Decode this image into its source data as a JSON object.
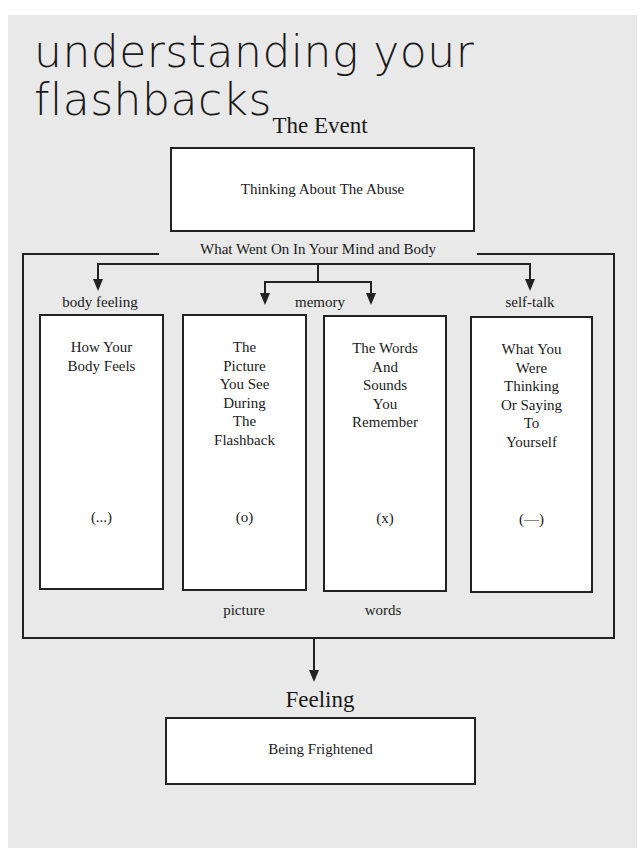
{
  "title": {
    "line1": "understanding your",
    "line2": "flashbacks"
  },
  "event": {
    "heading": "The Event",
    "box_text": "Thinking About The Abuse"
  },
  "process": {
    "label": "What Went On In Your Mind and Body",
    "categories": {
      "body_feeling": "body feeling",
      "memory": "memory",
      "self_talk": "self-talk"
    },
    "boxes": [
      {
        "lines": [
          "How Your",
          "Body Feels"
        ],
        "symbol": "(...)"
      },
      {
        "lines": [
          "The",
          "Picture",
          "You See",
          "During",
          "The",
          "Flashback"
        ],
        "symbol": "(o)"
      },
      {
        "lines": [
          "The Words",
          "And",
          "Sounds",
          "You",
          "Remember"
        ],
        "symbol": "(x)"
      },
      {
        "lines": [
          "What You",
          "Were",
          "Thinking",
          "Or Saying",
          "To",
          "Yourself"
        ],
        "symbol": "(—)"
      }
    ],
    "sub_labels": {
      "picture": "picture",
      "words": "words"
    }
  },
  "feeling": {
    "heading": "Feeling",
    "box_text": "Being Frightened"
  }
}
